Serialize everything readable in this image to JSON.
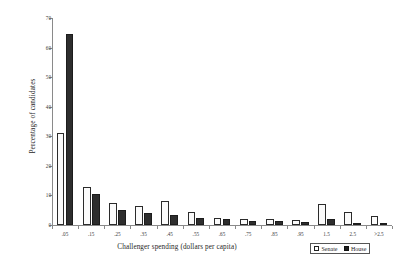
{
  "chart_data": {
    "type": "bar",
    "title": "",
    "xlabel": "Challenger spending (dollars per capita)",
    "ylabel": "Percentage of candidates",
    "categories": [
      ".05",
      ".15",
      ".25",
      ".35",
      ".45",
      ".55",
      ".65",
      ".75",
      ".85",
      ".95",
      "1.5",
      "2.5",
      ">2.5"
    ],
    "series": [
      {
        "name": "Senate",
        "color": "#ffffff",
        "values": [
          31,
          13,
          7.5,
          6.5,
          8,
          4.5,
          2.5,
          2,
          2,
          1.8,
          7,
          4.5,
          3
        ]
      },
      {
        "name": "House",
        "color": "#1f1f1f",
        "values": [
          64.5,
          10.5,
          5,
          4,
          3.5,
          2.5,
          2,
          1.5,
          1.2,
          1,
          2,
          0.8,
          0.5
        ]
      }
    ],
    "ylim": [
      0,
      70
    ],
    "yticks": [
      0,
      10,
      20,
      30,
      40,
      50,
      60,
      70
    ],
    "ytick_labels": [
      "0",
      "10",
      "20",
      "30",
      "40",
      "50",
      "60",
      "70"
    ],
    "grid": false,
    "legend_position": "bottom-right"
  },
  "legend": {
    "entries": [
      {
        "label": "Senate"
      },
      {
        "label": "House"
      }
    ]
  }
}
